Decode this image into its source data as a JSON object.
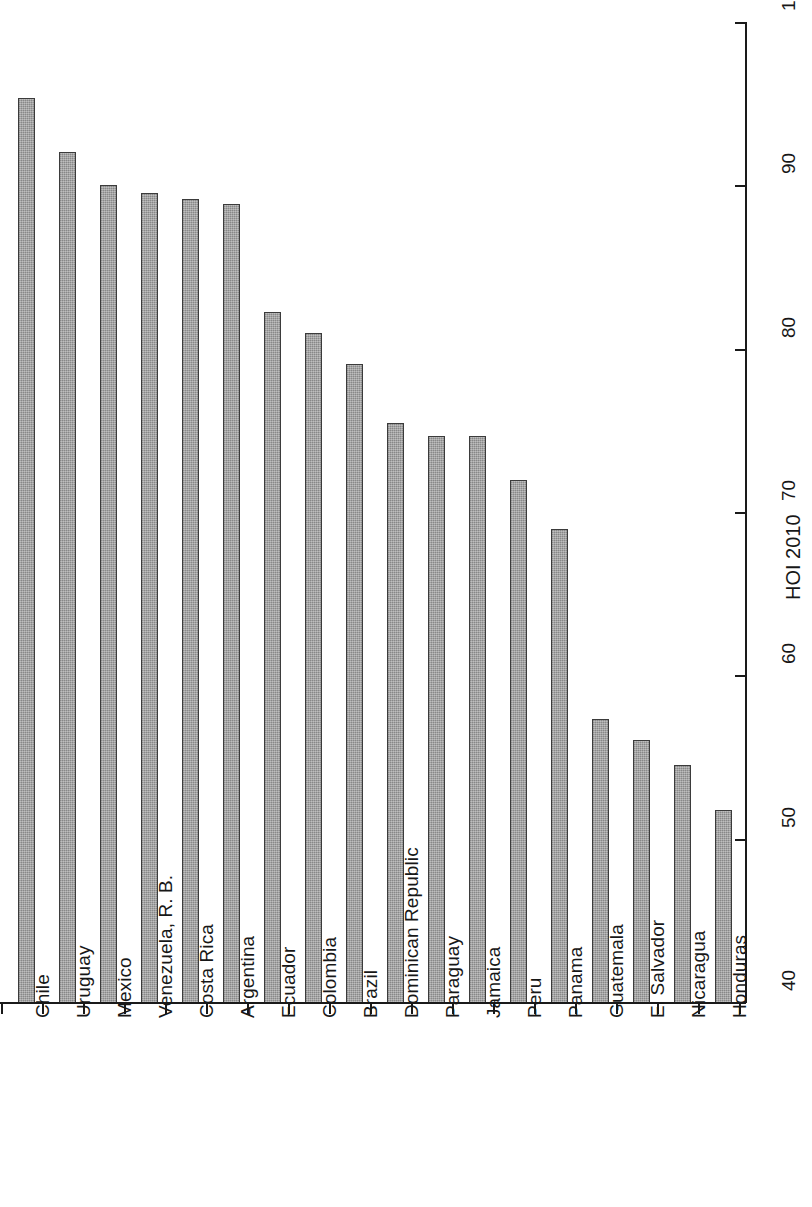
{
  "chart_data": {
    "type": "bar",
    "title": "",
    "subtitle": "",
    "orientation": "vertical-rotated",
    "xlabel": "",
    "ylabel": "HOI 2010",
    "ylim": [
      40,
      100
    ],
    "yticks": [
      40,
      50,
      60,
      70,
      80,
      90,
      100
    ],
    "grid": false,
    "legend": null,
    "bar_color": "#9a9a9a",
    "bar_border_color": "#3b3b3b",
    "axis_color": "#1a1a1a",
    "background": "#ffffff",
    "categories": [
      "Chile",
      "Uruguay",
      "Mexico",
      "Venezuela, R. B.",
      "Costa Rica",
      "Argentina",
      "Ecuador",
      "Colombia",
      "Brazil",
      "Dominican Republic",
      "Paraguay",
      "Jamaica",
      "Peru",
      "Panama",
      "Guatemala",
      "El Salvador",
      "Nicaragua",
      "Honduras"
    ],
    "values": [
      95.4,
      92.1,
      90.1,
      89.6,
      89.2,
      88.9,
      82.3,
      81.0,
      79.1,
      75.5,
      74.7,
      74.7,
      72.0,
      69.0,
      57.4,
      56.1,
      54.6,
      51.8
    ]
  },
  "axis": {
    "value_axis_title": "HOI 2010",
    "tick_labels": [
      "40",
      "50",
      "60",
      "70",
      "80",
      "90",
      "100"
    ]
  }
}
